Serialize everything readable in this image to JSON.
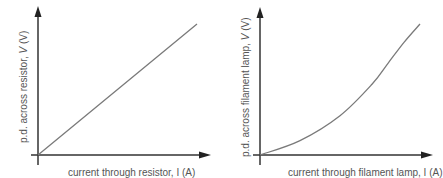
{
  "colors": {
    "axis": "#333333",
    "curve": "#7a7a7a",
    "label": "#555555"
  },
  "chart_data": [
    {
      "type": "line",
      "title": "",
      "ylabel_prefix": "p.d. across resistor, ",
      "ylabel_var": "V",
      "ylabel_unit": " (V)",
      "ylabel": "p.d. across resistor, V (V)",
      "xlabel": "current through resistor, I (A)",
      "xlabel_visible_note": "x-axis label cropped at bottom edge",
      "grid": false,
      "ticks": false,
      "shape": "straight line through origin (directly proportional)",
      "x": [
        0,
        0.25,
        0.5,
        0.75,
        1.0
      ],
      "y": [
        0,
        0.25,
        0.5,
        0.75,
        1.0
      ],
      "xlim": [
        0,
        1.08
      ],
      "ylim": [
        0,
        1.12
      ]
    },
    {
      "type": "line",
      "title": "",
      "ylabel_prefix": "p.d. across filament lamp, ",
      "ylabel_var": "V",
      "ylabel_unit": " (V)",
      "ylabel": "p.d. across filament lamp, V (V)",
      "xlabel": "current through filament lamp, I (A)",
      "xlabel_visible_note": "x-axis label cropped at bottom edge",
      "grid": false,
      "ticks": false,
      "shape": "curve through origin, gradient increasing (V rises faster as I increases)",
      "x": [
        0,
        0.25,
        0.5,
        0.7,
        0.8,
        0.9,
        1.0
      ],
      "y": [
        0,
        0.11,
        0.3,
        0.54,
        0.7,
        0.86,
        1.0
      ],
      "xlim": [
        0,
        1.08
      ],
      "ylim": [
        0,
        1.12
      ]
    }
  ]
}
